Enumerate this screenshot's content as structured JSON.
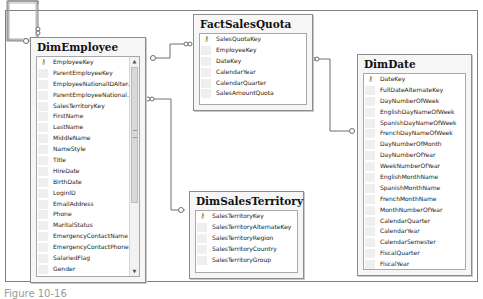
{
  "tables": {
    "dim_employee": {
      "name": "DimEmployee",
      "columns": [
        {
          "name": "EmployeeKey",
          "pk": true
        },
        {
          "name": "ParentEmployeeKey"
        },
        {
          "name": "EmployeeNationalIDAlter..."
        },
        {
          "name": "ParentEmployeeNational..."
        },
        {
          "name": "SalesTerritoryKey"
        },
        {
          "name": "FirstName"
        },
        {
          "name": "LastName"
        },
        {
          "name": "MiddleName"
        },
        {
          "name": "NameStyle"
        },
        {
          "name": "Title"
        },
        {
          "name": "HireDate"
        },
        {
          "name": "BirthDate"
        },
        {
          "name": "LoginID"
        },
        {
          "name": "EmailAddress"
        },
        {
          "name": "Phone"
        },
        {
          "name": "MaritalStatus"
        },
        {
          "name": "EmergencyContactName"
        },
        {
          "name": "EmergencyContactPhone"
        },
        {
          "name": "SalariedFlag"
        },
        {
          "name": "Gender"
        },
        {
          "name": "PayFrequency"
        }
      ],
      "scroll_up": "▲",
      "scroll_down": "▼"
    },
    "fact_sales_quota": {
      "name": "FactSalesQuota",
      "columns": [
        {
          "name": "SalesQuotaKey",
          "pk": true
        },
        {
          "name": "EmployeeKey"
        },
        {
          "name": "DateKey"
        },
        {
          "name": "CalendarYear"
        },
        {
          "name": "CalendarQuarter"
        },
        {
          "name": "SalesAmountQuota"
        }
      ]
    },
    "dim_date": {
      "name": "DimDate",
      "columns": [
        {
          "name": "DateKey",
          "pk": true
        },
        {
          "name": "FullDateAlternateKey"
        },
        {
          "name": "DayNumberOfWeek"
        },
        {
          "name": "EnglishDayNameOfWeek"
        },
        {
          "name": "SpanishDayNameOfWeek"
        },
        {
          "name": "FrenchDayNameOfWeek"
        },
        {
          "name": "DayNumberOfMonth"
        },
        {
          "name": "DayNumberOfYear"
        },
        {
          "name": "WeekNumberOfYear"
        },
        {
          "name": "EnglishMonthName"
        },
        {
          "name": "SpanishMonthName"
        },
        {
          "name": "FrenchMonthName"
        },
        {
          "name": "MonthNumberOfYear"
        },
        {
          "name": "CalendarQuarter"
        },
        {
          "name": "CalendarYear"
        },
        {
          "name": "CalendarSemester"
        },
        {
          "name": "FiscalQuarter"
        },
        {
          "name": "FiscalYear"
        },
        {
          "name": "FiscalSemester"
        }
      ]
    },
    "dim_sales_territory": {
      "name": "DimSalesTerritory",
      "columns": [
        {
          "name": "SalesTerritoryKey",
          "pk": true
        },
        {
          "name": "SalesTerritoryAlternateKey"
        },
        {
          "name": "SalesTerritoryRegion"
        },
        {
          "name": "SalesTerritoryCountry"
        },
        {
          "name": "SalesTerritoryGroup"
        }
      ]
    }
  },
  "icons": {
    "primary_key": "⚷"
  },
  "relationships": [
    {
      "from": "DimEmployee",
      "to": "DimEmployee",
      "type": "self"
    },
    {
      "from": "FactSalesQuota",
      "to": "DimEmployee"
    },
    {
      "from": "FactSalesQuota",
      "to": "DimDate"
    },
    {
      "from": "DimEmployee",
      "to": "DimSalesTerritory"
    }
  ],
  "caption": "Figure 10-16"
}
